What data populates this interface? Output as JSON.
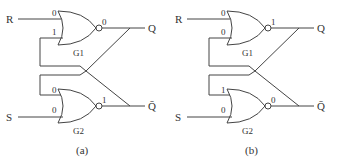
{
  "diagram": {
    "type": "SR latch using cross-coupled NOR gates",
    "panels": [
      {
        "caption": "(a)",
        "inputs": {
          "R": "R",
          "S": "S"
        },
        "outputs": {
          "Q": "Q",
          "Qbar": "Q̄"
        },
        "gates": [
          {
            "name": "G1",
            "type": "NOR",
            "in_top": "0",
            "in_bottom": "1",
            "out": "0"
          },
          {
            "name": "G2",
            "type": "NOR",
            "in_top": "0",
            "in_bottom": "0",
            "out": "1"
          }
        ]
      },
      {
        "caption": "(b)",
        "inputs": {
          "R": "R",
          "S": "S"
        },
        "outputs": {
          "Q": "Q",
          "Qbar": "Q̄"
        },
        "gates": [
          {
            "name": "G1",
            "type": "NOR",
            "in_top": "0",
            "in_bottom": "0",
            "out": "1"
          },
          {
            "name": "G2",
            "type": "NOR",
            "in_top": "1",
            "in_bottom": "0",
            "out": "0"
          }
        ]
      }
    ]
  },
  "colors": {
    "line": "#444444",
    "text": "#333333",
    "background": "#ffffff"
  }
}
